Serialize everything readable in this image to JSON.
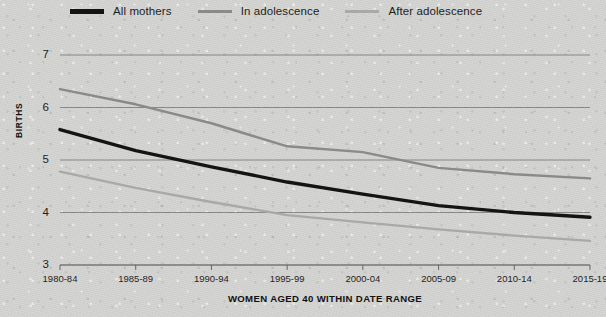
{
  "legend": {
    "items": [
      {
        "label": "All mothers",
        "color": "#141414",
        "weight": "thick"
      },
      {
        "label": "In adolescence",
        "color": "#8a8a8a",
        "weight": "thin"
      },
      {
        "label": "After adolescence",
        "color": "#a9a9a9",
        "weight": "thin"
      }
    ]
  },
  "axes": {
    "y_title": "BIRTHS",
    "x_title": "WOMEN AGED 40 WITHIN DATE RANGE",
    "y_ticks": [
      "3",
      "4",
      "5",
      "6",
      "7"
    ],
    "x_ticks": [
      "1980-84",
      "1985-89",
      "1990-94",
      "1995-99",
      "2000-04",
      "2005-09",
      "2010-14",
      "2015-19"
    ]
  },
  "chart_data": {
    "type": "line",
    "title": "",
    "subtitle": "",
    "xlabel": "WOMEN AGED 40 WITHIN DATE RANGE",
    "ylabel": "BIRTHS",
    "categories": [
      "1980-84",
      "1985-89",
      "1990-94",
      "1995-99",
      "2000-04",
      "2005-09",
      "2010-14",
      "2015-19"
    ],
    "series": [
      {
        "name": "All mothers",
        "color": "#141414",
        "values": [
          5.58,
          5.18,
          4.87,
          4.58,
          4.35,
          4.13,
          4.0,
          3.91
        ]
      },
      {
        "name": "In adolescence",
        "color": "#8a8a8a",
        "values": [
          6.35,
          6.06,
          5.7,
          5.26,
          5.15,
          4.85,
          4.73,
          4.65
        ]
      },
      {
        "name": "After adolescence",
        "color": "#a9a9a9",
        "values": [
          4.78,
          4.47,
          4.2,
          3.95,
          3.81,
          3.68,
          3.56,
          3.46
        ]
      }
    ],
    "ylim": [
      3,
      7
    ],
    "ytick_values": [
      3,
      4,
      5,
      6,
      7
    ],
    "grid": true,
    "legend_position": "top"
  },
  "geometry": {
    "plot_left": 60,
    "plot_right": 590,
    "plot_top": 33,
    "plot_bottom": 243,
    "y_min": 3,
    "y_max": 7
  }
}
